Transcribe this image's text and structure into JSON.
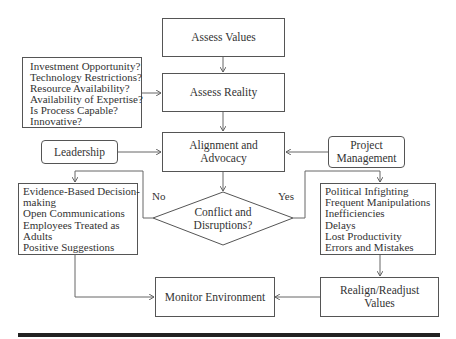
{
  "diagram": {
    "nodes": {
      "assess_values": {
        "label": "Assess Values"
      },
      "assess_reality": {
        "label": "Assess Reality"
      },
      "questions": {
        "items": [
          "Investment Opportunity?",
          "Technology Restrictions?",
          "Resource Availability?",
          "Availability of Expertise?",
          "Is Process Capable?",
          "Innovative?"
        ]
      },
      "alignment": {
        "line1": "Alignment and",
        "line2": "Advocacy"
      },
      "leadership": {
        "label": "Leadership"
      },
      "project_management": {
        "line1": "Project",
        "line2": "Management"
      },
      "decision": {
        "line1": "Conflict and",
        "line2": "Disruptions?"
      },
      "no_outcomes": {
        "items": [
          "Evidence-Based Decision-",
          "making",
          "Open Communications",
          "Employees Treated as",
          "Adults",
          "Positive Suggestions"
        ]
      },
      "yes_outcomes": {
        "items": [
          "Political Infighting",
          "Frequent Manipulations",
          "Inefficiencies",
          "Delays",
          "Lost Productivity",
          "Errors and Mistakes"
        ]
      },
      "monitor": {
        "label": "Monitor Environment"
      },
      "realign": {
        "line1": "Realign/Readjust",
        "line2": "Values"
      }
    },
    "edge_labels": {
      "no": "No",
      "yes": "Yes"
    },
    "colors": {
      "line": "#555555",
      "text": "#333333",
      "bar": "#222222"
    }
  }
}
